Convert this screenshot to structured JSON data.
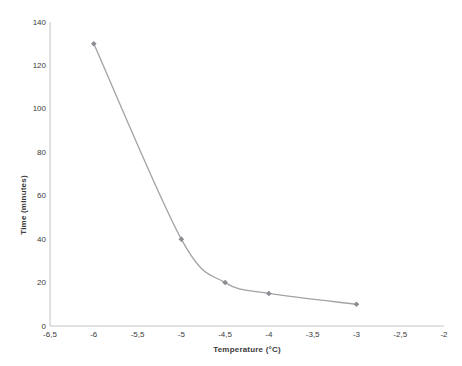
{
  "chart_data": {
    "type": "line",
    "title": "",
    "xlabel": "Temperature (°C)",
    "ylabel": "Time (minutes)",
    "x": [
      -6,
      -5,
      -4.5,
      -4,
      -3
    ],
    "y": [
      130,
      40,
      20,
      15,
      10
    ],
    "series": [
      {
        "name": "freezing-time-curve",
        "x": [
          -6,
          -5,
          -4.5,
          -4,
          -3
        ],
        "y": [
          130,
          40,
          20,
          15,
          10
        ]
      }
    ],
    "xlim": [
      -6.5,
      -2
    ],
    "ylim": [
      0,
      140
    ],
    "x_ticks": [
      -6.5,
      -6,
      -5.5,
      -5,
      -4.5,
      -4,
      -3.5,
      -3,
      -2.5,
      -2
    ],
    "x_tick_labels": [
      "-6,5",
      "-6",
      "-5,5",
      "-5",
      "-4,5",
      "-4",
      "-3,5",
      "-3",
      "-2,5",
      "-2"
    ],
    "y_ticks": [
      0,
      20,
      40,
      60,
      80,
      100,
      120,
      140
    ],
    "y_tick_labels": [
      "0",
      "20",
      "40",
      "60",
      "80",
      "100",
      "120",
      "140"
    ],
    "grid": false,
    "legend": "none",
    "line_smooth": true,
    "marker": "diamond",
    "colors": {
      "line": "#a2a2a7",
      "marker": "#8b8b92",
      "axis": "#c4c4c4",
      "text": "#3b3b3b",
      "background": "#ffffff"
    }
  }
}
